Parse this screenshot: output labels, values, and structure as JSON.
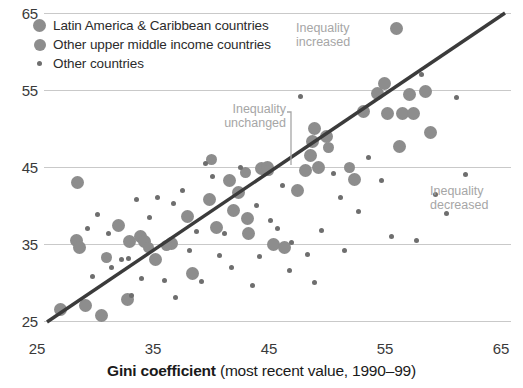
{
  "chart_data": {
    "type": "scatter",
    "title": "",
    "xlabel_bold": "Gini coefficient",
    "xlabel_rest": " (most recent value, 1990–99)",
    "ylabel": "",
    "xlim": [
      25,
      65
    ],
    "ylim": [
      25,
      65
    ],
    "xticks": [
      25,
      35,
      45,
      55,
      65
    ],
    "yticks": [
      25,
      35,
      45,
      55,
      65
    ],
    "grid": "horizontal",
    "legend_position": "top-left",
    "reference_line": {
      "label": "Inequality unchanged",
      "from": [
        25,
        25
      ],
      "to": [
        65,
        65
      ]
    },
    "annotations": [
      {
        "name": "inequality-increased",
        "line1": "Inequality",
        "line2": "increased"
      },
      {
        "name": "inequality-decreased",
        "line1": "Inequality",
        "line2": "decreased"
      },
      {
        "name": "inequality-unchanged",
        "line1": "Inequality",
        "line2": "unchanged"
      }
    ],
    "series": [
      {
        "name": "Latin America & Caribbean countries",
        "marker": "large-circle",
        "color": "#8d8d8d",
        "points": [
          [
            27.0,
            26.5
          ],
          [
            28.5,
            43.0
          ],
          [
            28.4,
            35.5
          ],
          [
            28.7,
            34.6
          ],
          [
            29.2,
            27.0
          ],
          [
            30.6,
            25.7
          ],
          [
            32.0,
            37.4
          ],
          [
            32.8,
            27.8
          ],
          [
            33.0,
            35.3
          ],
          [
            33.9,
            36.0
          ],
          [
            34.3,
            35.3
          ],
          [
            35.2,
            33.0
          ],
          [
            36.6,
            35.1
          ],
          [
            38.0,
            38.6
          ],
          [
            38.4,
            31.2
          ],
          [
            39.9,
            40.8
          ],
          [
            40.5,
            37.2
          ],
          [
            41.6,
            43.2
          ],
          [
            42.0,
            39.4
          ],
          [
            42.4,
            41.7
          ],
          [
            43.2,
            38.3
          ],
          [
            43.3,
            36.4
          ],
          [
            44.4,
            44.8
          ],
          [
            44.9,
            45.0
          ],
          [
            45.4,
            35.0
          ],
          [
            46.4,
            34.6
          ],
          [
            47.5,
            41.9
          ],
          [
            48.2,
            44.6
          ],
          [
            48.6,
            46.5
          ],
          [
            48.8,
            48.3
          ],
          [
            49.0,
            50.0
          ],
          [
            49.3,
            44.9
          ],
          [
            50.0,
            48.9
          ],
          [
            52.4,
            43.4
          ],
          [
            53.2,
            52.2
          ],
          [
            54.4,
            54.5
          ],
          [
            55.0,
            55.8
          ],
          [
            55.3,
            52.0
          ],
          [
            56.1,
            63.0
          ],
          [
            56.3,
            47.6
          ],
          [
            56.6,
            51.9
          ],
          [
            57.2,
            54.4
          ],
          [
            57.5,
            51.9
          ],
          [
            58.6,
            54.8
          ],
          [
            59.0,
            49.5
          ]
        ]
      },
      {
        "name": "Other upper middle income countries",
        "marker": "medium-circle",
        "color": "#8d8d8d",
        "points": [
          [
            31.0,
            33.2
          ],
          [
            34.6,
            34.6
          ],
          [
            36.2,
            34.8
          ],
          [
            40.1,
            46.0
          ],
          [
            43.0,
            44.3
          ],
          [
            45.0,
            44.6
          ],
          [
            50.2,
            47.5
          ],
          [
            52.0,
            45.0
          ]
        ]
      },
      {
        "name": "Other countries",
        "marker": "small-dot",
        "color": "#6e6e6e",
        "points": [
          [
            29.4,
            37.0
          ],
          [
            30.2,
            38.8
          ],
          [
            31.2,
            36.4
          ],
          [
            31.4,
            31.9
          ],
          [
            32.3,
            33.0
          ],
          [
            32.9,
            33.1
          ],
          [
            33.6,
            40.8
          ],
          [
            34.0,
            30.5
          ],
          [
            34.7,
            38.4
          ],
          [
            35.4,
            41.0
          ],
          [
            36.0,
            30.2
          ],
          [
            36.8,
            40.2
          ],
          [
            37.6,
            42.0
          ],
          [
            38.2,
            34.2
          ],
          [
            38.8,
            36.6
          ],
          [
            39.2,
            30.1
          ],
          [
            39.6,
            45.5
          ],
          [
            40.2,
            43.8
          ],
          [
            40.8,
            33.5
          ],
          [
            41.2,
            36.3
          ],
          [
            41.8,
            32.0
          ],
          [
            42.6,
            45.0
          ],
          [
            43.6,
            29.6
          ],
          [
            44.0,
            40.0
          ],
          [
            44.2,
            33.4
          ],
          [
            45.2,
            38.0
          ],
          [
            45.8,
            37.0
          ],
          [
            46.2,
            42.6
          ],
          [
            46.8,
            31.6
          ],
          [
            47.0,
            35.2
          ],
          [
            47.8,
            54.2
          ],
          [
            48.4,
            33.6
          ],
          [
            49.6,
            36.8
          ],
          [
            50.6,
            44.2
          ],
          [
            51.2,
            41.0
          ],
          [
            51.6,
            34.2
          ],
          [
            52.8,
            39.2
          ],
          [
            53.6,
            46.2
          ],
          [
            54.8,
            43.2
          ],
          [
            55.6,
            36.0
          ],
          [
            57.8,
            35.4
          ],
          [
            58.2,
            57.0
          ],
          [
            59.4,
            41.4
          ],
          [
            60.4,
            39.0
          ],
          [
            61.2,
            54.0
          ],
          [
            62.0,
            44.0
          ],
          [
            33.2,
            28.3
          ],
          [
            37.0,
            28.0
          ],
          [
            29.8,
            30.8
          ],
          [
            49.0,
            30.0
          ]
        ]
      }
    ]
  },
  "legend": {
    "items": [
      {
        "label": "Latin America & Caribbean countries",
        "marker": "large-circle"
      },
      {
        "label": "Other upper middle income countries",
        "marker": "medium-circle"
      },
      {
        "label": "Other countries",
        "marker": "small-dot"
      }
    ]
  },
  "axes": {
    "x": {
      "ticks": [
        "25",
        "35",
        "45",
        "55",
        "65"
      ]
    },
    "y": {
      "ticks": [
        "25",
        "35",
        "45",
        "55",
        "65"
      ]
    }
  },
  "annotations": {
    "increased": {
      "line1": "Inequality",
      "line2": "increased"
    },
    "decreased": {
      "line1": "Inequality",
      "line2": "decreased"
    },
    "unchanged": {
      "line1": "Inequality",
      "line2": "unchanged"
    }
  },
  "colors": {
    "marker": "#8d8d8d",
    "small_marker": "#6e6e6e",
    "reference_line": "#3b3b3b",
    "gridline": "#c9c9c9",
    "annotation_text": "#a6a6a6"
  }
}
